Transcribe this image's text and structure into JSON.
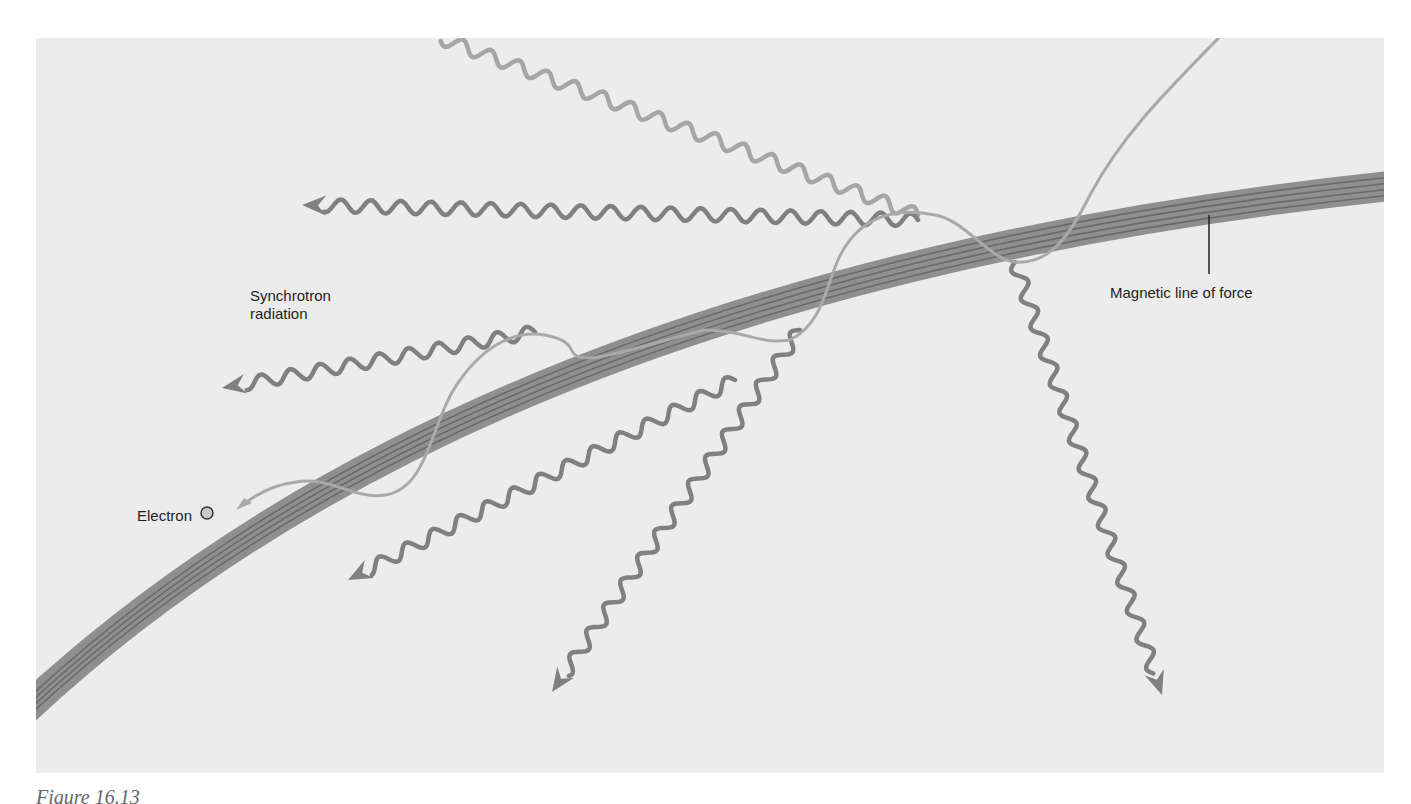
{
  "figure": {
    "labels": {
      "synchrotron": "Synchrotron radiation",
      "magnetic_line": "Magnetic line of force",
      "electron": "Electron"
    },
    "caption": "Figure 16.13"
  },
  "colors": {
    "background": "#ececec",
    "band_fill": "#8f8f8f",
    "band_lines": "#6a6a6a",
    "helix": "#a9a9a9",
    "wave": "#808080",
    "wave_light": "#a6a6a6",
    "text": "#1e1e1e"
  },
  "waves": [
    {
      "id": "wave-top-upper",
      "from": [
        918,
        215
      ],
      "to": [
        440,
        38
      ],
      "arrow": false,
      "shade": "wave_light"
    },
    {
      "id": "wave-top-left",
      "from": [
        918,
        220
      ],
      "to": [
        302,
        205
      ],
      "arrow": true,
      "shade": "wave"
    },
    {
      "id": "wave-mid-left",
      "from": [
        535,
        332
      ],
      "to": [
        222,
        388
      ],
      "arrow": true,
      "shade": "wave"
    },
    {
      "id": "wave-lower-left",
      "from": [
        735,
        380
      ],
      "to": [
        348,
        580
      ],
      "arrow": true,
      "shade": "wave"
    },
    {
      "id": "wave-bottom",
      "from": [
        800,
        330
      ],
      "to": [
        552,
        692
      ],
      "arrow": true,
      "shade": "wave"
    },
    {
      "id": "wave-right-down",
      "from": [
        1015,
        262
      ],
      "to": [
        1162,
        695
      ],
      "arrow": true,
      "shade": "wave"
    }
  ]
}
